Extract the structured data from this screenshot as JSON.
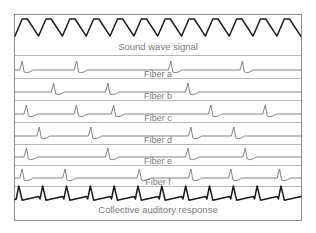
{
  "figure": {
    "background_color": "#ffffff",
    "frame_color": "#8b8b8b",
    "label_color": "#7a7a7a",
    "thin_trace_color": "#6e6e6e",
    "bold_trace_color": "#1a1a1a",
    "frame": {
      "x": 14,
      "y": 14,
      "width": 288,
      "height": 207
    }
  },
  "rows": [
    {
      "id": "sound-wave-signal",
      "label": "Sound wave signal",
      "trace_style": "bold",
      "wave_type": "triangle",
      "cycles": 12,
      "amplitude": 11,
      "baseline_y": 30,
      "band_top": 15,
      "band_bottom": 54,
      "label_y": 47
    },
    {
      "id": "fiber-a",
      "label": "Fiber a",
      "trace_style": "thin",
      "wave_type": "spikes",
      "spike_count": 4,
      "spike_positions": [
        0.025,
        0.215,
        0.545,
        0.795
      ],
      "amplitude": 9,
      "baseline_y": 70,
      "band_top": 55,
      "band_bottom": 77,
      "label_y": 75
    },
    {
      "id": "fiber-b",
      "label": "Fiber b",
      "trace_style": "thin",
      "wave_type": "spikes",
      "spike_count": 3,
      "spike_positions": [
        0.135,
        0.325,
        0.605
      ],
      "amplitude": 9,
      "baseline_y": 92,
      "band_top": 78,
      "band_bottom": 99,
      "label_y": 97
    },
    {
      "id": "fiber-c",
      "label": "Fiber c",
      "trace_style": "thin",
      "wave_type": "spikes",
      "spike_count": 5,
      "spike_positions": [
        0.04,
        0.215,
        0.345,
        0.685,
        0.875
      ],
      "amplitude": 9,
      "baseline_y": 114,
      "band_top": 100,
      "band_bottom": 121,
      "label_y": 119
    },
    {
      "id": "fiber-d",
      "label": "Fiber d",
      "trace_style": "thin",
      "wave_type": "spikes",
      "spike_count": 4,
      "spike_positions": [
        0.085,
        0.265,
        0.615,
        0.765
      ],
      "amplitude": 9,
      "baseline_y": 136,
      "band_top": 122,
      "band_bottom": 143,
      "label_y": 141
    },
    {
      "id": "fiber-e",
      "label": "Fiber e",
      "trace_style": "thin",
      "wave_type": "spikes",
      "spike_count": 4,
      "spike_positions": [
        0.04,
        0.325,
        0.605,
        0.805
      ],
      "amplitude": 9,
      "baseline_y": 157,
      "band_top": 144,
      "band_bottom": 164,
      "label_y": 162
    },
    {
      "id": "fiber-f",
      "label": "Fiber f",
      "trace_style": "thin",
      "wave_type": "spikes",
      "spike_count": 6,
      "spike_positions": [
        0.025,
        0.175,
        0.435,
        0.615,
        0.755,
        0.925
      ],
      "amplitude": 9,
      "baseline_y": 178,
      "band_top": 165,
      "band_bottom": 185,
      "label_y": 183
    },
    {
      "id": "collective-auditory-response",
      "label": "Collective auditory response",
      "trace_style": "bold",
      "wave_type": "sawtooth-spikes",
      "spike_count": 12,
      "amplitude": 10,
      "baseline_y": 196,
      "band_top": 186,
      "band_bottom": 221,
      "label_y": 210
    }
  ],
  "chart_data": {
    "type": "line",
    "xlabel": "",
    "ylabel": "",
    "grid": false,
    "legend_position": "inline-row-labels",
    "x_range": [
      0,
      1
    ],
    "series": [
      {
        "name": "Sound wave signal",
        "kind": "triangle-wave",
        "cycles": 12,
        "amplitude": 11,
        "color": "#1a1a1a"
      },
      {
        "name": "Fiber a",
        "kind": "spike-train",
        "spike_positions": [
          0.025,
          0.215,
          0.545,
          0.795
        ],
        "spike_count": 4,
        "color": "#6e6e6e"
      },
      {
        "name": "Fiber b",
        "kind": "spike-train",
        "spike_positions": [
          0.135,
          0.325,
          0.605
        ],
        "spike_count": 3,
        "color": "#6e6e6e"
      },
      {
        "name": "Fiber c",
        "kind": "spike-train",
        "spike_positions": [
          0.04,
          0.215,
          0.345,
          0.685,
          0.875
        ],
        "spike_count": 5,
        "color": "#6e6e6e"
      },
      {
        "name": "Fiber d",
        "kind": "spike-train",
        "spike_positions": [
          0.085,
          0.265,
          0.615,
          0.765
        ],
        "spike_count": 4,
        "color": "#6e6e6e"
      },
      {
        "name": "Fiber e",
        "kind": "spike-train",
        "spike_positions": [
          0.04,
          0.325,
          0.605,
          0.805
        ],
        "spike_count": 4,
        "color": "#6e6e6e"
      },
      {
        "name": "Fiber f",
        "kind": "spike-train",
        "spike_positions": [
          0.025,
          0.175,
          0.435,
          0.615,
          0.755,
          0.925
        ],
        "spike_count": 6,
        "color": "#6e6e6e"
      },
      {
        "name": "Collective auditory response",
        "kind": "periodic-spike-train",
        "spike_count": 12,
        "color": "#1a1a1a"
      }
    ]
  }
}
